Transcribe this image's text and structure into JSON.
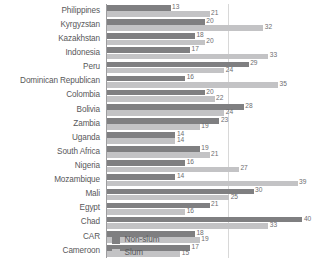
{
  "chart_data": {
    "type": "bar",
    "orientation": "horizontal",
    "title": "",
    "subtitle": "",
    "xlabel": "",
    "ylabel": "",
    "xlim": [
      0,
      44
    ],
    "grid": true,
    "gridlines": [
      25
    ],
    "legend_position": "bottom-right",
    "categories": [
      "Philippines",
      "Kyrgyzstan",
      "Kazakhstan",
      "Indonesia",
      "Peru",
      "Dominican Republican",
      "Colombia",
      "Bolivia",
      "Zambia",
      "Uganda",
      "South Africa",
      "Nigeria",
      "Mozambique",
      "Mali",
      "Egypt",
      "Chad",
      "CAR",
      "Cameroon"
    ],
    "series": [
      {
        "name": "Non-slum",
        "color": "#7f7f81",
        "values": [
          13,
          20,
          18,
          17,
          29,
          16,
          20,
          28,
          23,
          14,
          19,
          16,
          14,
          30,
          21,
          40,
          18,
          17
        ]
      },
      {
        "name": "Slum",
        "color": "#c3c3c5",
        "values": [
          21,
          32,
          20,
          33,
          24,
          35,
          22,
          24,
          19,
          14,
          21,
          27,
          39,
          25,
          16,
          33,
          19,
          15
        ]
      }
    ]
  },
  "legend": {
    "items": [
      {
        "label": "Non-slum",
        "color": "#7f7f81"
      },
      {
        "label": "Slum",
        "color": "#c3c3c5"
      }
    ]
  }
}
